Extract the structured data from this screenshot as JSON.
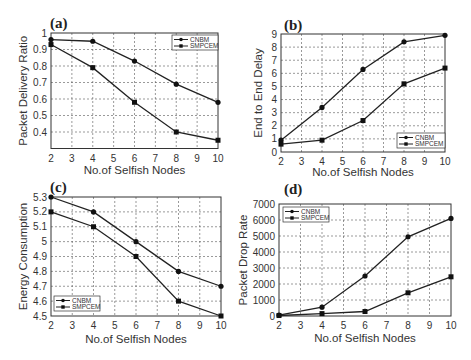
{
  "chart_data": [
    {
      "panel": "(a)",
      "type": "line",
      "title": "",
      "xlabel": "No.of Selfish Nodes",
      "ylabel": "Packet Delivery Ratio",
      "x": [
        2,
        4,
        6,
        8,
        10
      ],
      "xticks": [
        2,
        3,
        4,
        5,
        6,
        7,
        8,
        9,
        10
      ],
      "yticks": [
        0.4,
        0.5,
        0.6,
        0.7,
        0.8,
        0.9,
        1
      ],
      "ytick_labels": [
        "0.4",
        "0.5",
        "0.6",
        "0.7",
        "0.8",
        "0.9",
        "1"
      ],
      "xlim": [
        2,
        10
      ],
      "ylim": [
        0.3,
        1
      ],
      "grid": true,
      "legend_position": "upper right",
      "series": [
        {
          "name": "CNBM",
          "marker": "circle",
          "values": [
            0.96,
            0.95,
            0.83,
            0.69,
            0.58
          ]
        },
        {
          "name": "SMPCEM",
          "marker": "square",
          "values": [
            0.93,
            0.79,
            0.58,
            0.4,
            0.35
          ]
        }
      ]
    },
    {
      "panel": "(b)",
      "type": "line",
      "title": "",
      "xlabel": "No.of Selfish Nodes",
      "ylabel": "End to End Delay",
      "x": [
        2,
        4,
        6,
        8,
        10
      ],
      "xticks": [
        2,
        3,
        4,
        5,
        6,
        7,
        8,
        9,
        10
      ],
      "yticks": [
        0,
        1,
        2,
        3,
        4,
        5,
        6,
        7,
        8,
        9
      ],
      "ytick_labels": [
        "0",
        "1",
        "2",
        "3",
        "4",
        "5",
        "6",
        "7",
        "8",
        "9"
      ],
      "xlim": [
        2,
        10
      ],
      "ylim": [
        0,
        9
      ],
      "grid": true,
      "legend_position": "lower right",
      "series": [
        {
          "name": "CNBM",
          "marker": "circle",
          "values": [
            0.9,
            3.4,
            6.3,
            8.4,
            8.9
          ]
        },
        {
          "name": "SMPCEM",
          "marker": "square",
          "values": [
            0.6,
            0.9,
            2.4,
            5.2,
            6.4
          ]
        }
      ]
    },
    {
      "panel": "(c)",
      "type": "line",
      "title": "",
      "xlabel": "No.of Selfish Nodes",
      "ylabel": "Energy Consumption",
      "x": [
        2,
        4,
        6,
        8,
        10
      ],
      "xticks": [
        2,
        3,
        4,
        5,
        6,
        7,
        8,
        9,
        10
      ],
      "yticks": [
        4.5,
        4.6,
        4.7,
        4.8,
        4.9,
        5.0,
        5.1,
        5.2,
        5.3
      ],
      "ytick_labels": [
        "4.5",
        "4.6",
        "4.7",
        "4.8",
        "4.9",
        "5",
        "5.1",
        "5.2",
        "5.3"
      ],
      "xlim": [
        2,
        10
      ],
      "ylim": [
        4.5,
        5.3
      ],
      "grid": true,
      "legend_position": "lower left",
      "series": [
        {
          "name": "CNBM",
          "marker": "circle",
          "values": [
            5.3,
            5.2,
            5.0,
            4.8,
            4.7
          ]
        },
        {
          "name": "SMPCEM",
          "marker": "square",
          "values": [
            5.2,
            5.1,
            4.9,
            4.6,
            4.5
          ]
        }
      ]
    },
    {
      "panel": "(d)",
      "type": "line",
      "title": "",
      "xlabel": "No.of Selfish Nodes",
      "ylabel": "Packet Drop Rate",
      "x": [
        2,
        4,
        6,
        8,
        10
      ],
      "xticks": [
        2,
        3,
        4,
        5,
        6,
        7,
        8,
        9,
        10
      ],
      "yticks": [
        0,
        1000,
        2000,
        3000,
        4000,
        5000,
        6000,
        7000
      ],
      "ytick_labels": [
        "0",
        "1000",
        "2000",
        "3000",
        "4000",
        "5000",
        "6000",
        "7000"
      ],
      "xlim": [
        2,
        10
      ],
      "ylim": [
        0,
        7000
      ],
      "grid": true,
      "legend_position": "upper left",
      "series": [
        {
          "name": "CNBM",
          "marker": "circle",
          "values": [
            50,
            550,
            2500,
            4950,
            6100
          ]
        },
        {
          "name": "SMPCEM",
          "marker": "square",
          "values": [
            30,
            150,
            280,
            1450,
            2450
          ]
        }
      ]
    }
  ],
  "panels": {
    "a": {
      "label": "(a)",
      "xlabel": "No.of Selfish Nodes",
      "ylabel": "Packet Delivery Ratio",
      "legend": [
        "CNBM",
        "SMPCEM"
      ]
    },
    "b": {
      "label": "(b)",
      "xlabel": "No.of Selfish Nodes",
      "ylabel": "End to End Delay",
      "legend": [
        "CNBM",
        "SMPCEM"
      ]
    },
    "c": {
      "label": "(c)",
      "xlabel": "No.of Selfish Nodes",
      "ylabel": "Energy Consumption",
      "legend": [
        "CNBM",
        "SMPCEM"
      ]
    },
    "d": {
      "label": "(d)",
      "xlabel": "No.of Selfish Nodes",
      "ylabel": "Packet Drop Rate",
      "legend": [
        "CNBM",
        "SMPCEM"
      ]
    }
  }
}
